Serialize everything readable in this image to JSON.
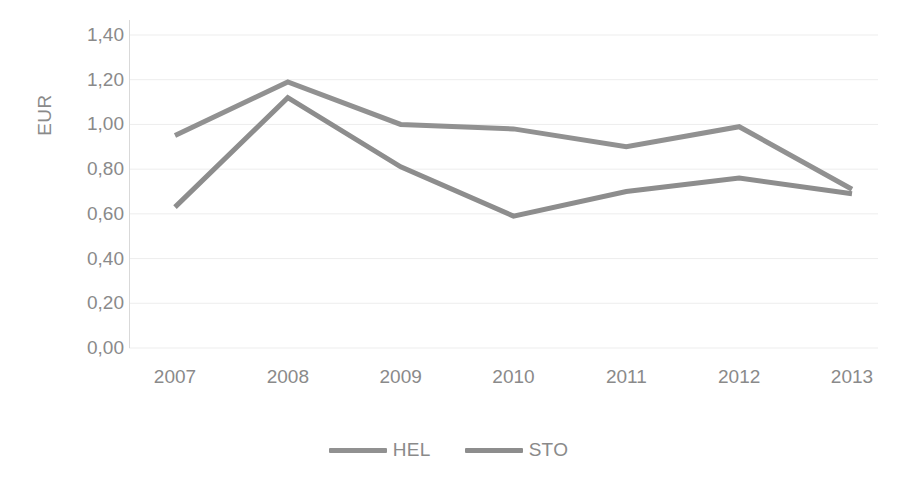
{
  "chart_data": {
    "type": "line",
    "title": "",
    "subtitle": "",
    "xlabel": "",
    "ylabel": "EUR",
    "categories": [
      "2007",
      "2008",
      "2009",
      "2010",
      "2011",
      "2012",
      "2013"
    ],
    "series": [
      {
        "name": "HEL",
        "color": "#919191",
        "values": [
          0.95,
          1.19,
          1.0,
          0.98,
          0.9,
          0.99,
          0.71
        ]
      },
      {
        "name": "STO",
        "color": "#8d8d8d",
        "values": [
          0.63,
          1.12,
          0.81,
          0.59,
          0.7,
          0.76,
          0.69
        ]
      }
    ],
    "ylim": [
      0.0,
      1.4
    ],
    "ytick_values": [
      0.0,
      0.2,
      0.4,
      0.6,
      0.8,
      1.0,
      1.2,
      1.4
    ],
    "ytick_labels": [
      "0,00",
      "0,20",
      "0,40",
      "0,60",
      "0,80",
      "1,00",
      "1,20",
      "1,40"
    ],
    "grid": "horizontal",
    "grid_color": "#ededed",
    "legend_position": "bottom",
    "legend_entries": [
      "HEL",
      "STO"
    ],
    "axis_color": "#d9d9d9",
    "text_color": "#8a8a8a",
    "markers": false,
    "annotations": []
  }
}
